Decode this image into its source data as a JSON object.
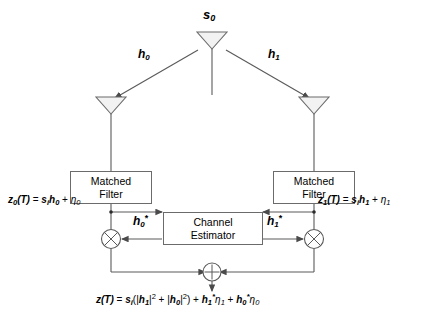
{
  "diagram": {
    "source_label": "s0",
    "source_label_base": "s",
    "source_label_sub": "0",
    "colors": {
      "line": "#5a5a5a",
      "box_border": "#6b6b6b",
      "antenna_fill": "#f2f2f2",
      "text": "#000000",
      "background": "#ffffff"
    }
  },
  "channels": {
    "left": {
      "name": "h0",
      "base": "h",
      "sub": "0"
    },
    "right": {
      "name": "h1",
      "base": "h",
      "sub": "1"
    }
  },
  "conjugates": {
    "left": {
      "name": "h0*",
      "base": "h",
      "sub": "0",
      "star": "*"
    },
    "right": {
      "name": "h1*",
      "base": "h",
      "sub": "1",
      "star": "*"
    }
  },
  "blocks": {
    "matched_filter_left": {
      "line1": "Matched",
      "line2": "Filter"
    },
    "matched_filter_right": {
      "line1": "Matched",
      "line2": "Filter"
    },
    "channel_estimator": {
      "line1": "Channel",
      "line2": "Estimator"
    }
  },
  "nodes": {
    "multiplier_left": {
      "glyph": "⊗",
      "name": "multiply"
    },
    "multiplier_right": {
      "glyph": "⊗",
      "name": "multiply"
    },
    "summer": {
      "glyph": "+",
      "name": "sum"
    }
  },
  "equations": {
    "left": {
      "text": "z0(T) = si h0 + η0",
      "lhs_base": "z",
      "lhs_sub": "0",
      "lhs_arg": "(T)",
      "eq": " = ",
      "s_base": "s",
      "s_sub": "i",
      "h_base": "h",
      "h_sub": "0",
      "plus": " + ",
      "noise_base": "η",
      "noise_sub": "0"
    },
    "right": {
      "text": "z1(T) = si h1 + η1",
      "lhs_base": "z",
      "lhs_sub": "1",
      "lhs_arg": "(T)",
      "eq": " = ",
      "s_base": "s",
      "s_sub": "i",
      "h_base": "h",
      "h_sub": "1",
      "plus": " + ",
      "noise_base": "η",
      "noise_sub": "1"
    },
    "output": {
      "text": "z(T) = si(| h1 |² + | h0 |²) + h1*η1 + h0*η0",
      "lhs_base": "z",
      "lhs_arg": "(T)",
      "eq": " = ",
      "s_base": "s",
      "s_sub": "i",
      "open": "(|",
      "h1_base": "h",
      "h1_sub": "1",
      "bar_sq1": "|",
      "sq1": "2",
      "mid_plus": " + |",
      "h0_base": "h",
      "h0_sub": "0",
      "bar_sq2": "|",
      "sq2": "2",
      "close": ")",
      "plus1": " + ",
      "c1_base": "h",
      "c1_sub": "1",
      "c1_star": "*",
      "n1_base": "η",
      "n1_sub": "1",
      "plus2": " + ",
      "c0_base": "h",
      "c0_sub": "0",
      "c0_star": "*",
      "n0_base": "η",
      "n0_sub": "0"
    }
  }
}
